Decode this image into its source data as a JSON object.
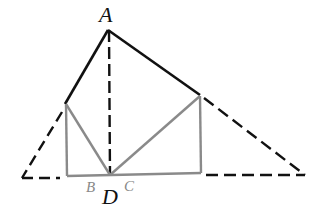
{
  "diagram": {
    "type": "geometry-figure",
    "labels": {
      "A": "A",
      "B": "B",
      "C": "C",
      "D": "D"
    },
    "colors": {
      "solid_line": "#111111",
      "dashed_line": "#111111",
      "gray_line": "#8a8a8a",
      "background": "#ffffff"
    },
    "points": {
      "A": [
        108,
        30
      ],
      "D": [
        110,
        175
      ],
      "P_left": [
        65,
        104
      ],
      "P_right": [
        200,
        95
      ],
      "B_corner": [
        67,
        176
      ],
      "C_corner": [
        201,
        173
      ],
      "left_base": [
        22,
        178
      ],
      "right_base": [
        305,
        175
      ]
    }
  }
}
